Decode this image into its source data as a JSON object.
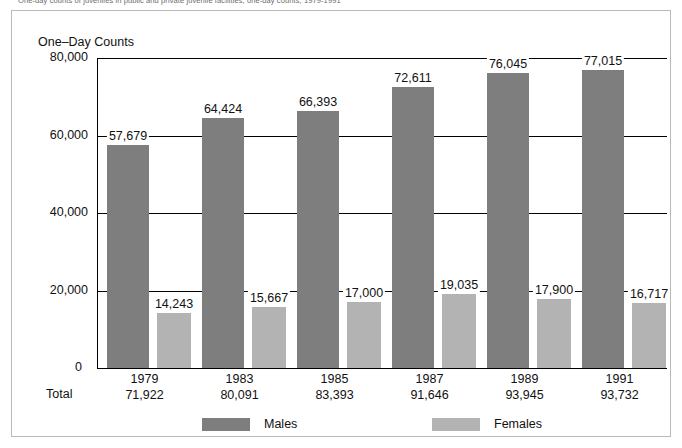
{
  "caption": "One-day counts of juveniles in public and private juvenile facilities, one-day counts, 1979-1991",
  "axis_title": "One–Day Counts",
  "total_word": "Total",
  "legend": [
    {
      "label": "Males",
      "color": "#7e7e7e"
    },
    {
      "label": "Females",
      "color": "#b3b3b3"
    }
  ],
  "chart_data": {
    "type": "bar",
    "title": "One–Day Counts",
    "xlabel": "",
    "ylabel": "One–Day Counts",
    "ylim": [
      0,
      80000
    ],
    "yticks": [
      "0",
      "20,000",
      "40,000",
      "60,000",
      "80,000"
    ],
    "ytick_values": [
      0,
      20000,
      40000,
      60000,
      80000
    ],
    "grid": true,
    "legend_position": "bottom",
    "categories": [
      "1979",
      "1983",
      "1985",
      "1987",
      "1989",
      "1991"
    ],
    "totals": [
      "71,922",
      "80,091",
      "83,393",
      "91,646",
      "93,945",
      "93,732"
    ],
    "total_values": [
      71922,
      80091,
      83393,
      91646,
      93945,
      93732
    ],
    "series": [
      {
        "name": "Males",
        "color": "#7e7e7e",
        "values": [
          57679,
          64424,
          66393,
          72611,
          76045,
          77015
        ],
        "labels": [
          "57,679",
          "64,424",
          "66,393",
          "72,611",
          "76,045",
          "77,015"
        ]
      },
      {
        "name": "Females",
        "color": "#b3b3b3",
        "values": [
          14243,
          15667,
          17000,
          19035,
          17900,
          16717
        ],
        "labels": [
          "14,243",
          "15,667",
          "17,000",
          "19,035",
          "17,900",
          "16,717"
        ]
      }
    ]
  }
}
